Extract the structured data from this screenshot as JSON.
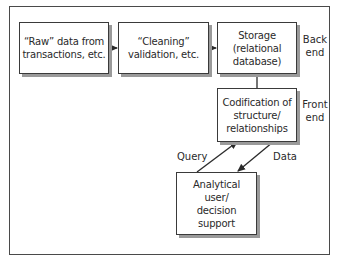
{
  "diagram": {
    "type": "flow",
    "nodes": [
      {
        "id": "raw",
        "label": "“Raw” data from\ntransactions, etc."
      },
      {
        "id": "cleaning",
        "label": "“Cleaning”\nvalidation, etc."
      },
      {
        "id": "storage",
        "label": "Storage\n(relational\ndatabase)"
      },
      {
        "id": "codification",
        "label": "Codification of\nstructure/\nrelationships"
      },
      {
        "id": "analytical",
        "label": "Analytical\nuser/\ndecision\nsupport"
      }
    ],
    "side_labels": {
      "back_end": "Back\nend",
      "front_end": "Front\nend"
    },
    "edge_labels": {
      "query": "Query",
      "data": "Data"
    },
    "edges": [
      {
        "from": "raw",
        "to": "cleaning"
      },
      {
        "from": "cleaning",
        "to": "storage"
      },
      {
        "from": "storage",
        "to": "codification",
        "style": "line"
      },
      {
        "from": "analytical",
        "to": "codification",
        "label": "Query"
      },
      {
        "from": "codification",
        "to": "analytical",
        "label": "Data"
      }
    ]
  }
}
